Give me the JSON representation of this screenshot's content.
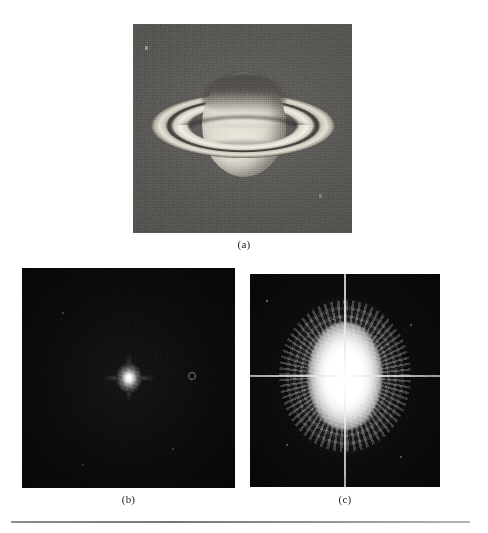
{
  "figure": {
    "kind": "three-panel-figure",
    "background_color": "#ffffff",
    "rule_color": "#808080",
    "panels": [
      {
        "id": "a",
        "caption": "(a)",
        "name": "saturn-photograph",
        "description": "Grainy grayscale telescope photograph of the planet Saturn with its ring system seen nearly edge-on, against a mid-gray noisy sky background",
        "background_color": "#575552",
        "bright_color": "#efece3",
        "dark_color": "#3d3b38"
      },
      {
        "id": "b",
        "caption": "(b)",
        "name": "fourier-spectrum-linear",
        "description": "Fourier transform magnitude of the Saturn image displayed on a linear intensity scale; almost entirely black with a single small bright spot at the origin (DC term)",
        "background_color": "#0a0a0a",
        "bright_color": "#ffffff"
      },
      {
        "id": "c",
        "caption": "(c)",
        "name": "fourier-spectrum-log",
        "description": "Same Fourier spectrum displayed after logarithmic intensity scaling; a large bright vertically elongated lobe at the center with radiating fringe lobes from the rings, crossed by bright horizontal and vertical axis lines",
        "background_color": "#0b0b0b",
        "bright_color": "#ffffff"
      }
    ]
  },
  "captions": {
    "a": "(a)",
    "b": "(b)",
    "c": "(c)"
  }
}
